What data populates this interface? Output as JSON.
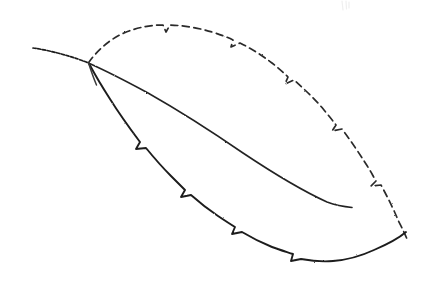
{
  "image": {
    "title": "Pencil sketch of a leaf",
    "subject": "leaf",
    "medium": "graphite pencil line drawing",
    "background_color": "#ffffff",
    "stroke_color": "#1c1c1c",
    "width": 426,
    "height": 294
  },
  "drawing": {
    "parts": [
      {
        "name": "petiole",
        "label": "leaf stalk",
        "description": "short dotted stalk running from the upper left down to the leaf base",
        "start": [
          33,
          48
        ],
        "end": [
          88,
          62
        ]
      },
      {
        "name": "upper-margin",
        "label": "upper leaf margin",
        "description": "serrated top edge sweeping right from the base and arcing down to the tip",
        "start": [
          88,
          62
        ],
        "end": [
          408,
          232
        ]
      },
      {
        "name": "lower-margin",
        "label": "lower leaf margin",
        "description": "serrated bottom edge running from the base down to the rounded right tip",
        "start": [
          88,
          62
        ],
        "end": [
          408,
          232
        ]
      },
      {
        "name": "midrib",
        "label": "midrib vein",
        "description": "central vein curving from the base and stopping short of the tip",
        "start": [
          89,
          63
        ],
        "end": [
          352,
          207
        ]
      },
      {
        "name": "base-fold",
        "label": "base fold line",
        "description": "short stroke at the base where the blade folds away from the stalk",
        "start": [
          88,
          63
        ],
        "end": [
          96,
          84
        ]
      }
    ],
    "serrations": {
      "label": "marginal teeth",
      "upper_count": 5,
      "lower_count": 5,
      "total_count": 10,
      "note": "small notched teeth spaced along both margins"
    },
    "faint_mark": {
      "label": "faint smudge",
      "color": "#efefef",
      "position": [
        344,
        4
      ]
    }
  },
  "geometry": {
    "petiole_path": "M 33 48 C 48 50, 66 55, 78 59 C 83 61, 86 62, 88.5 62.8",
    "upper_margin_path": "M 88.5 62.8 C 96 52, 108 40, 124 33 C 138 27, 152 25, 163 25 L 166 32 L 170 25 C 184 25.5, 199 28, 212 32 C 221 34.8, 228 37.5, 233 40 L 231 47 L 240 43 C 252 49, 263 56, 272 63 C 279 68.5, 284 73, 288 77 L 285 84 L 294 80 C 304 89, 315 99, 324 110 C 329 116, 333 121, 336 125 L 332 131 L 342 129 C 351 141, 359 153, 366 164 C 370 170, 373 176, 376 181 L 371 186 L 381 185 C 388 198, 394 210, 398 220 C 402 228, 405 234, 407 239",
    "lower_margin_path": "M 89 63.5 C 94 73, 101 85, 110 99 C 120 115, 131 130, 140 142 L 136 149 L 146 148 C 155 159, 163 168, 171 176 C 176 181, 181 186, 185 190 L 181 197 L 191 195 C 200 203, 209 210, 218 216 C 224 220, 230 224, 235 227 L 232 234 L 242 232 C 252 238, 262 243, 272 247 C 280 250, 287 252, 293 254 L 291 261 L 301 259 C 312 261, 323 262, 333 261 C 347 260, 361 256, 374 250 C 388 244, 399 238, 406 232",
    "midrib_path": "M 89.5 63.5 C 104 70, 124 80, 148 93 C 178 110, 211 131, 243 153 C 273 173, 305 192, 327 202 C 338 206, 347 207, 352 207.5",
    "base_fold_path": "M 88.5 63 C 90.5 69, 93 77, 96.5 85",
    "faint_mark_path": "M 342 1 L 343 10 M 346 1 L 346.5 9 M 349 2 L 349 8"
  }
}
